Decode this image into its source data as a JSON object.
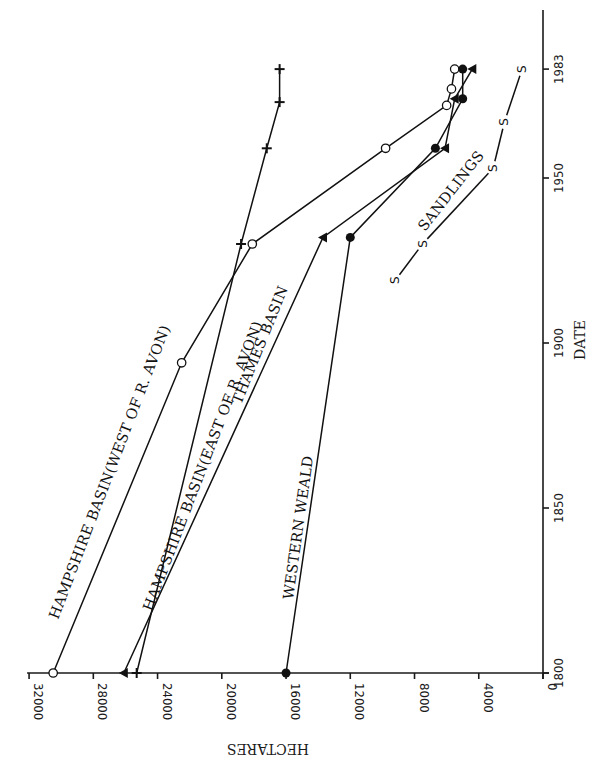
{
  "chart_data": {
    "type": "line",
    "title": "",
    "orientation_note": "figure printed rotated 90 degrees counter-clockwise",
    "xlabel": "DATE",
    "ylabel": "HECTARES",
    "x_ticks": [
      1800,
      1850,
      1900,
      1950,
      1983
    ],
    "y_ticks": [
      0,
      4000,
      8000,
      12000,
      16000,
      20000,
      24000,
      28000,
      32000
    ],
    "xlim": [
      1800,
      1983
    ],
    "ylim": [
      0,
      32000
    ],
    "grid": false,
    "legend": "inline labels along lines",
    "series": [
      {
        "name": "HAMPSHIRE BASIN(WEST OF R. AVON)",
        "marker": "open-circle",
        "points": [
          [
            1800,
            30500
          ],
          [
            1894,
            22500
          ],
          [
            1930,
            18100
          ],
          [
            1959,
            9800
          ],
          [
            1972,
            6000
          ],
          [
            1977,
            5700
          ],
          [
            1983,
            5500
          ]
        ]
      },
      {
        "name": "HAMPSHIRE BASIN(EAST OF R. AVON)",
        "marker": "cross",
        "points": [
          [
            1800,
            25300
          ],
          [
            1930,
            18800
          ],
          [
            1959,
            17200
          ],
          [
            1973,
            16400
          ],
          [
            1983,
            16400
          ]
        ]
      },
      {
        "name": "THAMES BASIN",
        "marker": "filled-triangle",
        "points": [
          [
            1800,
            26100
          ],
          [
            1932,
            13700
          ],
          [
            1959,
            6100
          ],
          [
            1974,
            5500
          ],
          [
            1983,
            4400
          ]
        ]
      },
      {
        "name": "WESTERN WEALD",
        "marker": "filled-circle",
        "points": [
          [
            1800,
            16000
          ],
          [
            1932,
            12000
          ],
          [
            1959,
            6700
          ],
          [
            1974,
            5000
          ],
          [
            1983,
            5000
          ]
        ]
      },
      {
        "name": "SANDLINGS",
        "marker": "S",
        "points": [
          [
            1919,
            9200
          ],
          [
            1930,
            7500
          ],
          [
            1953,
            3100
          ],
          [
            1967,
            2400
          ],
          [
            1983,
            1300
          ]
        ]
      }
    ]
  },
  "labels": {
    "hampshire_west": "HAMPSHIRE BASIN(WEST OF R. AVON)",
    "hampshire_east": "HAMPSHIRE BASIN(EAST OF R. AVON)",
    "thames": "THAMES BASIN",
    "weald": "WESTERN WEALD",
    "sandlings": "SANDLINGS",
    "x_axis_title": "DATE",
    "y_axis_title": "HECTARES",
    "s_marker": "S"
  }
}
